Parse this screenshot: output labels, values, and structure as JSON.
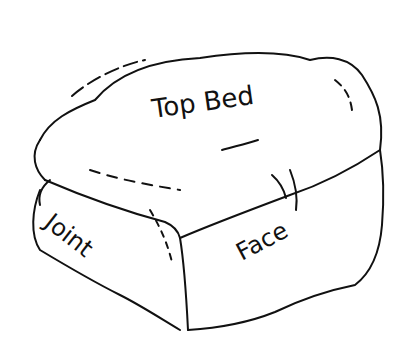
{
  "diagram": {
    "labels": {
      "top": "Top Bed",
      "side_left": "Joint",
      "side_right": "Face"
    },
    "underline_word": "Bed",
    "stroke_color": "#111111",
    "background": "#ffffff"
  }
}
